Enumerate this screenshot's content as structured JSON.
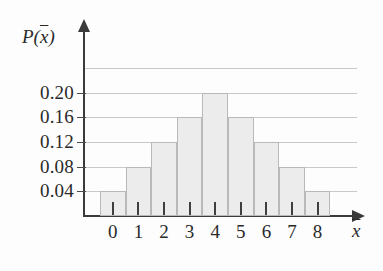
{
  "chart_data": {
    "type": "bar",
    "title": "",
    "subtitle": "",
    "xlabel": "x̄",
    "ylabel": "P(x̄)",
    "categories": [
      "0",
      "1",
      "2",
      "3",
      "4",
      "5",
      "6",
      "7",
      "8"
    ],
    "values": [
      0.04,
      0.08,
      0.12,
      0.16,
      0.2,
      0.16,
      0.12,
      0.08,
      0.04
    ],
    "ylim": [
      0,
      0.24
    ],
    "xlim": [
      -0.5,
      8.5
    ],
    "y_ticks": [
      0.04,
      0.08,
      0.12,
      0.16,
      0.2
    ],
    "y_tick_labels": [
      "0.04",
      "0.08",
      "0.12",
      "0.16",
      "0.20"
    ],
    "x_tick_labels": [
      "0",
      "1",
      "2",
      "3",
      "4",
      "5",
      "6",
      "7",
      "8"
    ],
    "gridlines": [
      0.04,
      0.08,
      0.12,
      0.16,
      0.2,
      0.24
    ],
    "grid": true,
    "grid_orientation": "horizontal",
    "legend": null,
    "legend_position": "none",
    "annotations": [],
    "bar_fill_color": "#ececec",
    "bar_edge_color": "#b9b9b9",
    "axis_color": "#3a3a3a",
    "grid_color": "#c9c9c9",
    "background_color": "#fdfdfd",
    "axis_arrows": true
  },
  "axes": {
    "y_title_prefix": "P(",
    "y_title_var": "x",
    "y_title_suffix": ")",
    "x_title_var": "x"
  }
}
